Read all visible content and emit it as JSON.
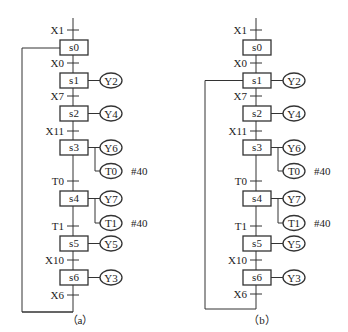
{
  "diagrams": [
    {
      "id": "a",
      "caption": "（a）",
      "steps": [
        {
          "label": "s0",
          "transition_in": "X1",
          "outputs": []
        },
        {
          "label": "s1",
          "transition_in": "X0",
          "outputs": [
            {
              "label": "Y2"
            }
          ]
        },
        {
          "label": "s2",
          "transition_in": "X7",
          "outputs": [
            {
              "label": "Y4"
            }
          ]
        },
        {
          "label": "s3",
          "transition_in": "X11",
          "outputs": [
            {
              "label": "Y6"
            },
            {
              "label": "T0",
              "note": "#40"
            }
          ]
        },
        {
          "label": "s4",
          "transition_in": "T0",
          "outputs": [
            {
              "label": "Y7"
            },
            {
              "label": "T1",
              "note": "#40"
            }
          ]
        },
        {
          "label": "s5",
          "transition_in": "T1",
          "outputs": [
            {
              "label": "Y5"
            }
          ]
        },
        {
          "label": "s6",
          "transition_in": "X10",
          "outputs": [
            {
              "label": "Y3"
            }
          ]
        }
      ],
      "final_transition": "X6",
      "loop_back_to": "s0"
    },
    {
      "id": "b",
      "caption": "（b）",
      "steps": [
        {
          "label": "s0",
          "transition_in": "X1",
          "outputs": []
        },
        {
          "label": "s1",
          "transition_in": "X0",
          "outputs": [
            {
              "label": "Y2"
            }
          ]
        },
        {
          "label": "s2",
          "transition_in": "X7",
          "outputs": [
            {
              "label": "Y4"
            }
          ]
        },
        {
          "label": "s3",
          "transition_in": "X11",
          "outputs": [
            {
              "label": "Y6"
            },
            {
              "label": "T0",
              "note": "#40"
            }
          ]
        },
        {
          "label": "s4",
          "transition_in": "T0",
          "outputs": [
            {
              "label": "Y7"
            },
            {
              "label": "T1",
              "note": "#40"
            }
          ]
        },
        {
          "label": "s5",
          "transition_in": "T1",
          "outputs": [
            {
              "label": "Y5"
            }
          ]
        },
        {
          "label": "s6",
          "transition_in": "X10",
          "outputs": [
            {
              "label": "Y3"
            }
          ]
        }
      ],
      "final_transition": "X6",
      "loop_back_to": "s1"
    }
  ]
}
